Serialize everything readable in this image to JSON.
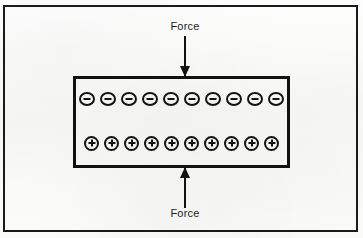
{
  "figure": {
    "background_color": "#fbfbfa",
    "ink_color": "#121212"
  },
  "frame": {
    "name": "outer figure border",
    "border_color": "#1a1a1a",
    "border_width_px": 2
  },
  "material": {
    "name": "crystal block",
    "border_color": "#111111",
    "border_width_px": 3,
    "fill": "none"
  },
  "charges": {
    "negative_row": {
      "symbol": "−",
      "sign": "negative",
      "count": 10,
      "position": "top"
    },
    "positive_row": {
      "symbol": "+",
      "sign": "positive",
      "count": 10,
      "position": "bottom"
    }
  },
  "arrows": {
    "top": {
      "label": "Force",
      "direction": "down",
      "points_toward": "material block"
    },
    "bottom": {
      "label": "Force",
      "direction": "up",
      "points_toward": "material block"
    }
  }
}
